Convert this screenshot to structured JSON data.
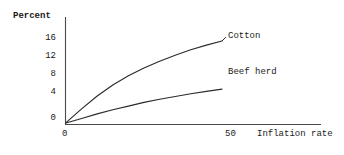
{
  "chart_data": {
    "type": "line",
    "title": "",
    "subtitle": "",
    "xlabel": "Inflation rate",
    "ylabel": "Percent",
    "grid": false,
    "legend_position": "inline-right-of-curve-ends",
    "xlim": [
      0,
      60
    ],
    "ylim": [
      0,
      18.5
    ],
    "xticks": [
      0,
      50
    ],
    "xtick_labels": [
      "0",
      "50"
    ],
    "yticks": [
      0,
      4,
      8,
      12,
      16
    ],
    "ytick_labels": [
      "0",
      "4",
      "8",
      "12",
      "16"
    ],
    "series": [
      {
        "name": "Cotton",
        "x": [
          0,
          5,
          10,
          15,
          20,
          25,
          30,
          35,
          40,
          45,
          50
        ],
        "values": [
          0.2,
          3.2,
          6.0,
          8.4,
          10.4,
          12.1,
          13.6,
          14.9,
          16.1,
          17.1,
          18.0
        ]
      },
      {
        "name": "Beef herd",
        "x": [
          0,
          5,
          10,
          15,
          20,
          25,
          30,
          35,
          40,
          45,
          50
        ],
        "values": [
          0.1,
          1.1,
          2.1,
          3.0,
          3.8,
          4.6,
          5.3,
          5.9,
          6.5,
          7.0,
          7.5
        ]
      }
    ],
    "annotations": [
      {
        "text": "Cotton",
        "attached_to": "Cotton",
        "position": "end-of-line"
      },
      {
        "text": "Beef herd",
        "attached_to": "Beef herd",
        "position": "end-of-line"
      }
    ]
  },
  "axes": {
    "y_axis_title": "Percent",
    "x_axis_title": "Inflation rate",
    "y_tick_labels": [
      "16",
      "12",
      "8",
      "4",
      "0"
    ],
    "x_tick_labels": [
      "0",
      "50"
    ]
  },
  "style": {
    "line_color": "#2b2b2b",
    "axis_color": "#4a4a4a",
    "text_color": "#1a1a1a",
    "background": "#ffffff"
  }
}
